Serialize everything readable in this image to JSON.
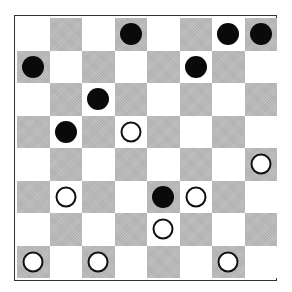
{
  "board": {
    "rows": 8,
    "cols": 8,
    "dark_square_rule": "row_plus_col_odd",
    "colors": {
      "light_square": "#ffffff",
      "dark_square": "#b9b9b9",
      "black_piece": "#0a0a0a",
      "white_piece_fill": "#ffffff",
      "white_piece_outline": "#111111",
      "border": "#333333"
    },
    "pieces": [
      {
        "row": 0,
        "col": 3,
        "color": "black"
      },
      {
        "row": 0,
        "col": 6,
        "color": "black"
      },
      {
        "row": 0,
        "col": 7,
        "color": "black"
      },
      {
        "row": 1,
        "col": 0,
        "color": "black"
      },
      {
        "row": 1,
        "col": 5,
        "color": "black"
      },
      {
        "row": 2,
        "col": 2,
        "color": "black"
      },
      {
        "row": 3,
        "col": 1,
        "color": "black"
      },
      {
        "row": 3,
        "col": 3,
        "color": "white"
      },
      {
        "row": 4,
        "col": 7,
        "color": "white"
      },
      {
        "row": 5,
        "col": 1,
        "color": "white"
      },
      {
        "row": 5,
        "col": 4,
        "color": "black"
      },
      {
        "row": 5,
        "col": 5,
        "color": "white"
      },
      {
        "row": 6,
        "col": 4,
        "color": "white"
      },
      {
        "row": 7,
        "col": 0,
        "color": "white"
      },
      {
        "row": 7,
        "col": 2,
        "color": "white"
      },
      {
        "row": 7,
        "col": 6,
        "color": "white"
      }
    ]
  }
}
